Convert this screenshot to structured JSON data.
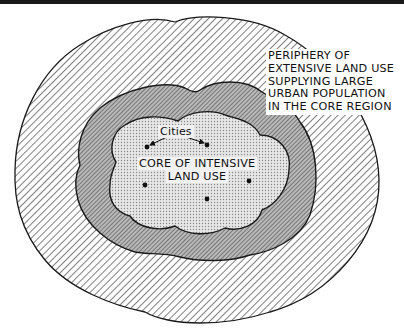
{
  "diagram": {
    "type": "concentric land-use regions",
    "zones": [
      {
        "id": "periphery",
        "pattern": "sparse diagonal hatching",
        "description": "outer ring"
      },
      {
        "id": "intermediate",
        "pattern": "dense diagonal hatching (dark gray)",
        "description": "middle ring"
      },
      {
        "id": "core",
        "pattern": "fine dot stipple (light gray)",
        "description": "inner lobed region"
      }
    ],
    "labels": {
      "periphery": [
        "PERIPHERY OF",
        "EXTENSIVE LAND USE",
        "SUPPLYING LARGE",
        "URBAN POPULATION",
        "IN THE CORE REGION"
      ],
      "core": [
        "CORE OF INTENSIVE",
        "LAND USE"
      ],
      "cities": "Cities"
    },
    "cities": [
      {
        "x": 147,
        "y": 147
      },
      {
        "x": 207,
        "y": 145
      },
      {
        "x": 145,
        "y": 185
      },
      {
        "x": 249,
        "y": 181
      },
      {
        "x": 207,
        "y": 199
      }
    ],
    "colors": {
      "outline": "#1a1a1a",
      "hatch": "#333333",
      "middle_fill": "#8a8a8a",
      "core_fill": "#d8d8d8",
      "background": "#ffffff"
    }
  }
}
